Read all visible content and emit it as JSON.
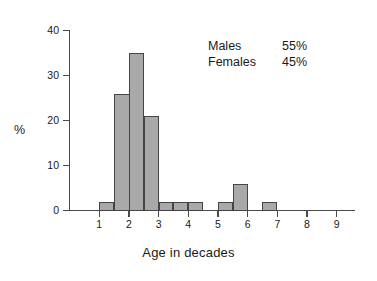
{
  "chart_data": {
    "type": "bar",
    "title": "",
    "subtitle": "",
    "xlabel": "Age in decades",
    "ylabel": "%",
    "xlim": [
      0,
      9.6
    ],
    "ylim": [
      0,
      40
    ],
    "grid": false,
    "legend_position": "inside-top-right",
    "x_ticks": [
      "1",
      "2",
      "3",
      "4",
      "5",
      "6",
      "7",
      "8",
      "9"
    ],
    "x_tick_values": [
      1,
      2,
      3,
      4,
      5,
      6,
      7,
      8,
      9
    ],
    "y_ticks": [
      "0",
      "10",
      "20",
      "30",
      "40"
    ],
    "y_tick_values": [
      0,
      10,
      20,
      30,
      40
    ],
    "bar_fill_color": "#a9a9a9",
    "bar_edge_color": "#454545",
    "axis_color": "#4a4a4a",
    "bins": [
      {
        "label": "1.0-1.5",
        "start": 1.0,
        "end": 1.5,
        "value": 2
      },
      {
        "label": "1.5-2.5",
        "start": 1.5,
        "end": 2.5,
        "value": 26
      },
      {
        "label": "2.0-2.5",
        "start": 2.0,
        "end": 2.5,
        "value": 35
      },
      {
        "label": "2.5-3.0",
        "start": 2.5,
        "end": 3.0,
        "value": 21
      },
      {
        "label": "3.0-3.5",
        "start": 3.0,
        "end": 3.5,
        "value": 2
      },
      {
        "label": "3.5-4.0",
        "start": 3.5,
        "end": 4.0,
        "value": 2
      },
      {
        "label": "4.0-4.5",
        "start": 4.0,
        "end": 4.5,
        "value": 2
      },
      {
        "label": "5.0-5.5",
        "start": 5.0,
        "end": 5.5,
        "value": 2
      },
      {
        "label": "5.5-6.0",
        "start": 5.5,
        "end": 6.0,
        "value": 6
      },
      {
        "label": "6.5-7.0",
        "start": 6.5,
        "end": 7.0,
        "value": 2
      }
    ],
    "categories": [
      "1.0-1.5",
      "1.5-2.0",
      "2.0-2.5",
      "2.5-3.0",
      "3.0-3.5",
      "3.5-4.0",
      "4.0-4.5",
      "4.5-5.0",
      "5.0-5.5",
      "5.5-6.0",
      "6.0-6.5",
      "6.5-7.0"
    ],
    "values": [
      2,
      26,
      35,
      21,
      2,
      2,
      2,
      0,
      2,
      6,
      0,
      2
    ],
    "annotations": [
      {
        "label": "Males",
        "value": "55%"
      },
      {
        "label": "Females",
        "value": "45%"
      }
    ]
  }
}
